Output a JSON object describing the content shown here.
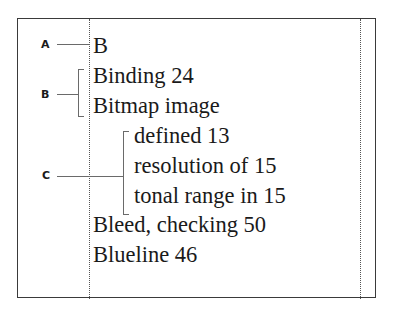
{
  "diagram": {
    "type": "index-layout-callout",
    "callouts": [
      {
        "label": "A",
        "target": "section-letter"
      },
      {
        "label": "B",
        "target": "first-level-entries"
      },
      {
        "label": "C",
        "target": "second-level-subentries"
      }
    ],
    "index_entries": [
      {
        "text": "B",
        "level": "section"
      },
      {
        "text": "Binding 24",
        "level": 1
      },
      {
        "text": "Bitmap image",
        "level": 1
      },
      {
        "text": "defined 13",
        "level": 2
      },
      {
        "text": "resolution of 15",
        "level": 2
      },
      {
        "text": "tonal range in 15",
        "level": 2
      },
      {
        "text": "Bleed, checking 50",
        "level": 1
      },
      {
        "text": "Blueline 46",
        "level": 1
      }
    ]
  }
}
